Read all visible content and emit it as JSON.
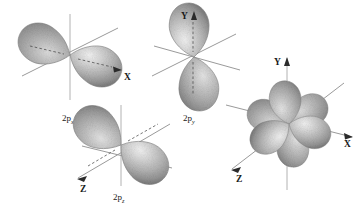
{
  "figure": {
    "background_color": "#ffffff",
    "lobe_color_light": "#e4e4e4",
    "lobe_color_mid": "#b0b0b0",
    "lobe_color_dark": "#828282",
    "axis_color": "#9a9a9a",
    "text_color": "#1a1a1a"
  },
  "panels": [
    {
      "id": "panel-px",
      "label_main": "2p",
      "label_sub": "x",
      "orientation": "along-x",
      "axes": [
        {
          "name": "x-axis",
          "label": "X",
          "arrow": true
        },
        {
          "name": "y-axis",
          "label": "",
          "arrow": false
        },
        {
          "name": "z-axis",
          "label": "",
          "arrow": false
        }
      ]
    },
    {
      "id": "panel-py",
      "label_main": "2p",
      "label_sub": "y",
      "orientation": "along-y",
      "axes": [
        {
          "name": "y-axis",
          "label": "Y",
          "arrow": true
        },
        {
          "name": "x-axis",
          "label": "",
          "arrow": false
        },
        {
          "name": "z-axis",
          "label": "",
          "arrow": false
        }
      ]
    },
    {
      "id": "panel-pz",
      "label_main": "2p",
      "label_sub": "z",
      "orientation": "along-z",
      "axes": [
        {
          "name": "z-axis",
          "label": "Z",
          "arrow": true
        },
        {
          "name": "x-axis",
          "label": "",
          "arrow": false
        },
        {
          "name": "y-axis",
          "label": "",
          "arrow": false
        }
      ]
    },
    {
      "id": "panel-composite",
      "label_main": "",
      "label_sub": "",
      "orientation": "composite",
      "axes": [
        {
          "name": "y-axis",
          "label": "Y",
          "arrow": true
        },
        {
          "name": "x-axis",
          "label": "X",
          "arrow": true
        },
        {
          "name": "z-axis",
          "label": "Z",
          "arrow": true
        }
      ]
    }
  ],
  "labels": {
    "px": "2p",
    "px_sub": "x",
    "py": "2p",
    "py_sub": "y",
    "pz": "2p",
    "pz_sub": "z",
    "axis_x": "X",
    "axis_y": "Y",
    "axis_z": "Z",
    "axis_x2": "X",
    "axis_y2": "Y",
    "axis_z2": "Z"
  }
}
